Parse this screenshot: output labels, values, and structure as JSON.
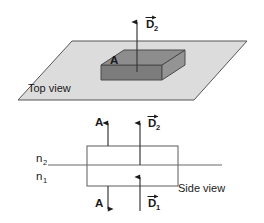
{
  "figure": {
    "title_top": "Top view",
    "title_side": "Side view",
    "labels": {
      "area_top": "A",
      "flux_top": "D",
      "flux_top_sub": "2",
      "area_side_up": "A",
      "area_side_down": "A",
      "flux_side_up": "D",
      "flux_side_up_sub": "2",
      "flux_side_down": "D",
      "flux_side_down_sub": "1",
      "index_upper": "n",
      "index_upper_sub": "2",
      "index_lower": "n",
      "index_lower_sub": "1"
    },
    "colors": {
      "plane_fill": "#dcdcdc",
      "slab_top_fill": "#8d8d8d",
      "slab_front_fill": "#7c7c7c",
      "slab_side_fill": "#949494",
      "outline": "#555555",
      "text": "#1a1a1a",
      "background": "#ffffff"
    },
    "geometry": {
      "plane_points": "18,100 72,41 247,41 194,100",
      "slab_top_points": "101,65 124,50 185,50 162,65",
      "slab_front_points": "101,65 162,65 162,80 101,80",
      "slab_side_points": "162,65 185,50 185,65 162,80",
      "rect_x": 87,
      "rect_y": 146,
      "rect_w": 91,
      "rect_h": 40,
      "interface_y": 165,
      "interface_x1": 48,
      "interface_x2": 222
    },
    "arrows": {
      "top_d2": {
        "x": 137,
        "y_tail": 72,
        "y_head": 20,
        "dir": "up"
      },
      "side_a_up": {
        "x": 108,
        "y_tail": 146,
        "y_head": 121,
        "dir": "up"
      },
      "side_d2_up": {
        "x": 140,
        "y_tail": 146,
        "y_head": 121,
        "dir": "up"
      },
      "side_a_down": {
        "x": 108,
        "y_tail": 186,
        "y_head": 211,
        "dir": "down"
      },
      "side_d1_up": {
        "x": 140,
        "y_tail": 211,
        "y_head": 176,
        "dir": "up"
      }
    }
  }
}
